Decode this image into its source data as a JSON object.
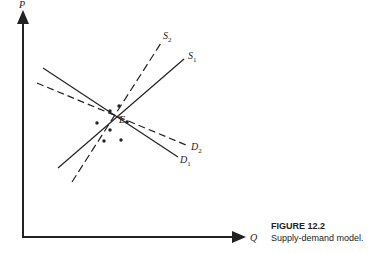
{
  "figure": {
    "caption_title": "FIGURE 12.2",
    "caption_text": "Supply-demand model."
  },
  "axes": {
    "y_label": "P",
    "x_label": "Q"
  },
  "curves": {
    "S1": {
      "name": "S",
      "sub": "1",
      "style": "solid"
    },
    "S2": {
      "name": "S",
      "sub": "2",
      "style": "dashed"
    },
    "D1": {
      "name": "D",
      "sub": "1",
      "style": "solid"
    },
    "D2": {
      "name": "D",
      "sub": "2",
      "style": "dashed"
    }
  },
  "equilibrium_label": "E",
  "colors": {
    "ink": "#222222",
    "background": "#ffffff"
  }
}
